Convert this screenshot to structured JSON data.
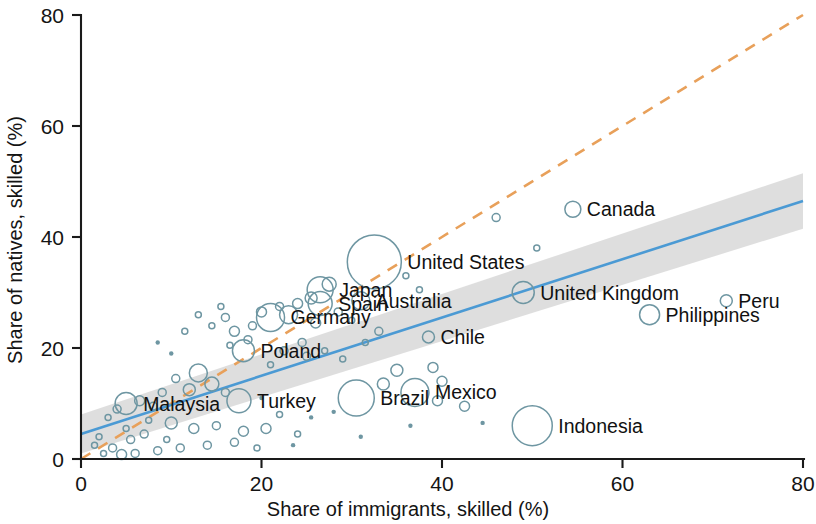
{
  "chart_data": {
    "type": "scatter",
    "title": "",
    "subtitle": "",
    "xlabel": "Share of immigrants, skilled (%)",
    "ylabel": "Share of natives, skilled (%)",
    "xlim": [
      0,
      80
    ],
    "ylim": [
      0,
      80
    ],
    "xticks": [
      0,
      20,
      40,
      60,
      80
    ],
    "yticks": [
      0,
      20,
      40,
      60,
      80
    ],
    "xtick_labels": [
      "0",
      "20",
      "40",
      "60",
      "80"
    ],
    "ytick_labels": [
      "0",
      "20",
      "40",
      "60",
      "80"
    ],
    "grid": false,
    "legend": "none",
    "marker_style": "open circle, size proportional to country population / immigrant stock",
    "series": [
      {
        "name": "Countries (bubble size = magnitude)",
        "marker_color": "#6e96a2",
        "labeled_points": [
          {
            "label": "Canada",
            "x": 54.5,
            "y": 45.0,
            "size": 8,
            "label_side": "right"
          },
          {
            "label": "United States",
            "x": 32.5,
            "y": 35.5,
            "size": 27,
            "label_side": "right"
          },
          {
            "label": "Peru",
            "x": 71.5,
            "y": 28.5,
            "size": 6,
            "label_side": "right"
          },
          {
            "label": "United Kingdom",
            "x": 49.0,
            "y": 30.0,
            "size": 11,
            "label_side": "right"
          },
          {
            "label": "Japan",
            "x": 26.5,
            "y": 30.5,
            "size": 13,
            "label_side": "right"
          },
          {
            "label": "Australia",
            "x": 31.0,
            "y": 28.5,
            "size": 9,
            "label_side": "right"
          },
          {
            "label": "Spain",
            "x": 26.5,
            "y": 28.0,
            "size": 12,
            "label_side": "right"
          },
          {
            "label": "Germany",
            "x": 21.0,
            "y": 25.5,
            "size": 14,
            "label_side": "right"
          },
          {
            "label": "Philippines",
            "x": 63.0,
            "y": 26.0,
            "size": 10,
            "label_side": "right"
          },
          {
            "label": "Chile",
            "x": 38.5,
            "y": 22.0,
            "size": 6,
            "label_side": "right"
          },
          {
            "label": "Poland",
            "x": 18.0,
            "y": 19.5,
            "size": 11,
            "label_side": "right"
          },
          {
            "label": "Mexico",
            "x": 37.0,
            "y": 12.0,
            "size": 14,
            "label_side": "right"
          },
          {
            "label": "Brazil",
            "x": 30.5,
            "y": 11.0,
            "size": 18,
            "label_side": "right"
          },
          {
            "label": "Turkey",
            "x": 17.5,
            "y": 10.5,
            "size": 12,
            "label_side": "right"
          },
          {
            "label": "Malaysia",
            "x": 5.0,
            "y": 10.0,
            "size": 11,
            "label_side": "right"
          },
          {
            "label": "Indonesia",
            "x": 50.0,
            "y": 6.0,
            "size": 20,
            "label_side": "right"
          }
        ],
        "unlabeled_points": [
          {
            "x": 27.5,
            "y": 31.5,
            "size": 7
          },
          {
            "x": 25.5,
            "y": 29.0,
            "size": 6
          },
          {
            "x": 24.0,
            "y": 28.0,
            "size": 5
          },
          {
            "x": 22.0,
            "y": 27.5,
            "size": 4
          },
          {
            "x": 23.0,
            "y": 26.0,
            "size": 9
          },
          {
            "x": 20.0,
            "y": 26.5,
            "size": 5
          },
          {
            "x": 19.0,
            "y": 24.0,
            "size": 4
          },
          {
            "x": 17.0,
            "y": 23.0,
            "size": 5
          },
          {
            "x": 16.0,
            "y": 25.5,
            "size": 4
          },
          {
            "x": 14.5,
            "y": 24.0,
            "size": 3
          },
          {
            "x": 13.0,
            "y": 26.0,
            "size": 3
          },
          {
            "x": 15.5,
            "y": 27.5,
            "size": 3
          },
          {
            "x": 11.5,
            "y": 23.0,
            "size": 3
          },
          {
            "x": 16.5,
            "y": 20.5,
            "size": 3
          },
          {
            "x": 18.5,
            "y": 21.5,
            "size": 4
          },
          {
            "x": 26.0,
            "y": 24.5,
            "size": 5
          },
          {
            "x": 28.5,
            "y": 26.5,
            "size": 4
          },
          {
            "x": 30.0,
            "y": 25.0,
            "size": 3
          },
          {
            "x": 24.5,
            "y": 21.0,
            "size": 4
          },
          {
            "x": 22.5,
            "y": 19.5,
            "size": 4
          },
          {
            "x": 21.0,
            "y": 17.0,
            "size": 3
          },
          {
            "x": 25.0,
            "y": 18.5,
            "size": 4
          },
          {
            "x": 27.0,
            "y": 19.5,
            "size": 3
          },
          {
            "x": 29.0,
            "y": 18.0,
            "size": 3
          },
          {
            "x": 31.5,
            "y": 21.0,
            "size": 3
          },
          {
            "x": 33.0,
            "y": 23.0,
            "size": 4
          },
          {
            "x": 46.0,
            "y": 43.5,
            "size": 4
          },
          {
            "x": 50.5,
            "y": 38.0,
            "size": 3
          },
          {
            "x": 36.0,
            "y": 33.0,
            "size": 3
          },
          {
            "x": 37.5,
            "y": 30.5,
            "size": 3
          },
          {
            "x": 33.5,
            "y": 13.5,
            "size": 6
          },
          {
            "x": 35.0,
            "y": 16.0,
            "size": 6
          },
          {
            "x": 39.0,
            "y": 16.5,
            "size": 5
          },
          {
            "x": 40.0,
            "y": 14.0,
            "size": 5
          },
          {
            "x": 42.5,
            "y": 9.5,
            "size": 5
          },
          {
            "x": 39.5,
            "y": 10.5,
            "size": 5
          },
          {
            "x": 13.0,
            "y": 15.5,
            "size": 9
          },
          {
            "x": 14.5,
            "y": 13.5,
            "size": 7
          },
          {
            "x": 12.0,
            "y": 12.5,
            "size": 6
          },
          {
            "x": 10.5,
            "y": 14.5,
            "size": 4
          },
          {
            "x": 16.0,
            "y": 12.0,
            "size": 4
          },
          {
            "x": 9.0,
            "y": 12.0,
            "size": 4
          },
          {
            "x": 8.0,
            "y": 9.5,
            "size": 4
          },
          {
            "x": 6.5,
            "y": 10.5,
            "size": 5
          },
          {
            "x": 4.0,
            "y": 9.0,
            "size": 4
          },
          {
            "x": 3.0,
            "y": 7.5,
            "size": 3
          },
          {
            "x": 7.5,
            "y": 7.0,
            "size": 3
          },
          {
            "x": 10.0,
            "y": 6.5,
            "size": 6
          },
          {
            "x": 12.5,
            "y": 5.5,
            "size": 5
          },
          {
            "x": 15.0,
            "y": 6.0,
            "size": 4
          },
          {
            "x": 18.0,
            "y": 5.0,
            "size": 5
          },
          {
            "x": 20.5,
            "y": 5.5,
            "size": 5
          },
          {
            "x": 17.0,
            "y": 3.0,
            "size": 4
          },
          {
            "x": 14.0,
            "y": 2.5,
            "size": 4
          },
          {
            "x": 11.0,
            "y": 2.0,
            "size": 4
          },
          {
            "x": 8.5,
            "y": 1.5,
            "size": 4
          },
          {
            "x": 6.0,
            "y": 1.0,
            "size": 4
          },
          {
            "x": 4.5,
            "y": 0.8,
            "size": 5
          },
          {
            "x": 3.5,
            "y": 2.0,
            "size": 4
          },
          {
            "x": 2.5,
            "y": 1.0,
            "size": 3
          },
          {
            "x": 5.5,
            "y": 3.5,
            "size": 4
          },
          {
            "x": 7.0,
            "y": 4.5,
            "size": 4
          },
          {
            "x": 9.5,
            "y": 3.5,
            "size": 3
          },
          {
            "x": 2.0,
            "y": 4.0,
            "size": 3
          },
          {
            "x": 1.5,
            "y": 2.5,
            "size": 3
          },
          {
            "x": 5.0,
            "y": 5.5,
            "size": 3
          },
          {
            "x": 22.0,
            "y": 8.0,
            "size": 3
          },
          {
            "x": 24.0,
            "y": 4.5,
            "size": 3
          },
          {
            "x": 19.5,
            "y": 2.0,
            "size": 3
          },
          {
            "x": 10.0,
            "y": 19.0,
            "size": 2
          },
          {
            "x": 8.5,
            "y": 21.0,
            "size": 2
          },
          {
            "x": 23.5,
            "y": 2.5,
            "size": 2
          },
          {
            "x": 25.5,
            "y": 7.5,
            "size": 2
          },
          {
            "x": 20.0,
            "y": 11.0,
            "size": 2
          },
          {
            "x": 28.0,
            "y": 8.5,
            "size": 2
          },
          {
            "x": 44.5,
            "y": 6.5,
            "size": 2
          },
          {
            "x": 36.5,
            "y": 6.0,
            "size": 2
          },
          {
            "x": 31.0,
            "y": 4.0,
            "size": 2
          }
        ]
      }
    ],
    "reference_lines": [
      {
        "name": "identity-line",
        "style": "dashed",
        "color": "#e8a05a",
        "description": "45-degree line where share of immigrants equals share of natives",
        "from": [
          0,
          0
        ],
        "to": [
          80,
          80
        ]
      },
      {
        "name": "regression-fit-line",
        "style": "solid",
        "color": "#4b9ad4",
        "description": "linear best-fit of natives on immigrants",
        "from": [
          0,
          4.5
        ],
        "to": [
          80,
          46.5
        ]
      }
    ],
    "confidence_band": {
      "name": "confidence-interval-band",
      "color": "#c9c9c9",
      "description": "shaded confidence interval around the regression line",
      "lower": [
        [
          0,
          1.0
        ],
        [
          80,
          41.5
        ]
      ],
      "upper": [
        [
          0,
          8.0
        ],
        [
          80,
          51.5
        ]
      ]
    }
  }
}
